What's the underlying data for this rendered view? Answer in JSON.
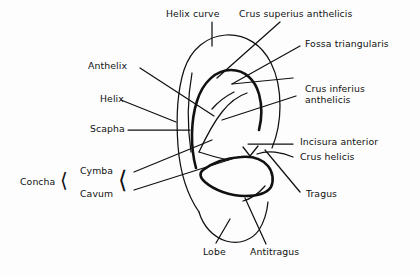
{
  "figure": {
    "background_color": "#fdfdfd",
    "ink_color": "#111111"
  },
  "labels": {
    "helix_curve": "Helix curve",
    "crus_superius_anthelicis": "Crus superius anthelicis",
    "fossa_triangularis": "Fossa triangularis",
    "crus_inferius_anthelicis_line1": "Crus inferius",
    "crus_inferius_anthelicis_line2": "anthelicis",
    "incisura_anterior": "Incisura anterior",
    "crus_helicis": "Crus helicis",
    "tragus": "Tragus",
    "antitragus": "Antitragus",
    "lobe": "Lobe",
    "cavum": "Cavum",
    "cymba": "Cymba",
    "concha": "Concha",
    "scapha": "Scapha",
    "helix": "Helix",
    "anthelix": "Anthelix"
  },
  "brackets": {
    "concha_bracket": "⟨",
    "cymba_cavum_bracket": "⟨"
  }
}
